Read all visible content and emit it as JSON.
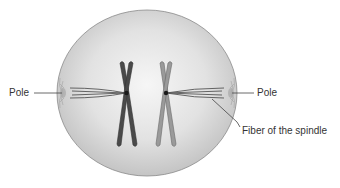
{
  "diagram": {
    "labels": {
      "pole_left": "Pole",
      "pole_right": "Pole",
      "fiber": "Fiber of the spindle"
    },
    "colors": {
      "cell_fill_center": "#f4f4f4",
      "cell_fill_edge": "#c8c8c8",
      "cell_outline": "#8a8a8a",
      "chromosome_dark": "#4a4a4a",
      "chromosome_light": "#9a9a9a",
      "fiber": "#555555",
      "leader_line": "#444444"
    }
  }
}
